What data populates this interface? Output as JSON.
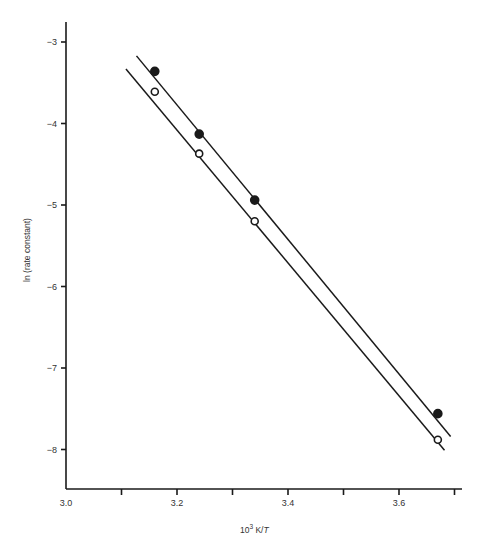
{
  "chart_data": {
    "type": "line",
    "title": "",
    "xlabel": "10³ K/T",
    "xlabel_parts": {
      "base": "10",
      "sup": "3",
      "rest": " K/",
      "italic": "T"
    },
    "ylabel": "ln (rate constant)",
    "xlim": [
      3.0,
      3.72
    ],
    "ylim": [
      -8.5,
      -2.75
    ],
    "x_ticks": [
      3.0,
      3.1,
      3.2,
      3.3,
      3.4,
      3.5,
      3.6,
      3.7
    ],
    "x_tick_labels": [
      "3.0",
      "",
      "3.2",
      "",
      "3.4",
      "",
      "3.6",
      ""
    ],
    "y_ticks": [
      -3,
      -4,
      -5,
      -6,
      -7,
      -8
    ],
    "y_tick_labels": [
      "−3",
      "−4",
      "−5",
      "−6",
      "−7",
      "−8"
    ],
    "grid": false,
    "legend": null,
    "series": [
      {
        "name": "filled circles",
        "marker": "filled-circle",
        "x": [
          3.16,
          3.24,
          3.34,
          3.67
        ],
        "y": [
          -3.36,
          -4.13,
          -4.94,
          -7.56
        ],
        "fit_line": {
          "x": [
            3.127,
            3.693
          ],
          "y": [
            -3.17,
            -7.84
          ]
        }
      },
      {
        "name": "open circles",
        "marker": "open-circle",
        "x": [
          3.16,
          3.24,
          3.34,
          3.67
        ],
        "y": [
          -3.61,
          -4.37,
          -5.2,
          -7.88
        ],
        "fit_line": {
          "x": [
            3.108,
            3.682
          ],
          "y": [
            -3.33,
            -8.01
          ]
        }
      }
    ]
  },
  "colors": {
    "ink": "#1a1a1a",
    "background": "#ffffff"
  }
}
